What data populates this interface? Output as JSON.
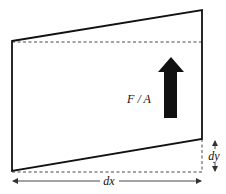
{
  "diagram": {
    "labels": {
      "force_per_area": "F / A",
      "horizontal_dimension": "dx",
      "vertical_displacement": "dy"
    },
    "shape": {
      "deformed_block": {
        "top_left": [
          12,
          41
        ],
        "top_right": [
          202,
          10
        ],
        "bottom_right": [
          202,
          139
        ],
        "bottom_left": [
          12,
          171
        ]
      },
      "reference_lines": {
        "top_dashed_y": 42,
        "bottom_dashed_y": 172,
        "right_dashed_x": 202
      }
    },
    "colors": {
      "stroke": "#111111",
      "arrow_fill": "#111111",
      "background": "#ffffff"
    }
  }
}
